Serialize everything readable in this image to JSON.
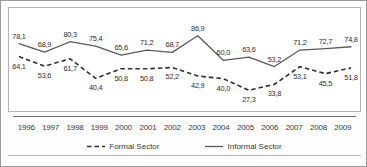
{
  "chart_data": {
    "type": "line",
    "title": "",
    "subtitle": "",
    "xlabel": "",
    "ylabel": "",
    "grid": false,
    "legend_position": "bottom",
    "ylim": [
      20,
      92
    ],
    "categories": [
      "1996",
      "1997",
      "1998",
      "1999",
      "2000",
      "2001",
      "2002",
      "2003",
      "2004",
      "2005",
      "2006",
      "2007",
      "2008",
      "2009"
    ],
    "series": [
      {
        "name": "Informal Sector",
        "style": "solid",
        "color": "#5a5a5a",
        "values": [
          78.1,
          68.9,
          80.3,
          75.4,
          65.6,
          71.2,
          68.7,
          86.9,
          60.0,
          63.6,
          53.2,
          71.2,
          72.7,
          74.8
        ],
        "labels": [
          "78,1",
          "68,9",
          "80,3",
          "75,4",
          "65,6",
          "71,2",
          "68,7",
          "86,9",
          "60,0",
          "63,6",
          "53,2",
          "71,2",
          "72,7",
          "74,8"
        ]
      },
      {
        "name": "Formal Sector",
        "style": "dashed",
        "color": "#2f2f2f",
        "values": [
          64.1,
          53.6,
          61.7,
          40.4,
          50.8,
          50.8,
          52.2,
          42.9,
          40.0,
          27.3,
          33.8,
          53.1,
          45.5,
          51.8
        ],
        "labels": [
          "64,1",
          "53,6",
          "61,7",
          "40,4",
          "50,8",
          "50,8",
          "52,2",
          "42,9",
          "40,0",
          "27,3",
          "33,8",
          "53,1",
          "45,5",
          "51,8"
        ]
      }
    ]
  },
  "legend": {
    "formal": "Formal Sector",
    "informal": "Informal Sector"
  }
}
